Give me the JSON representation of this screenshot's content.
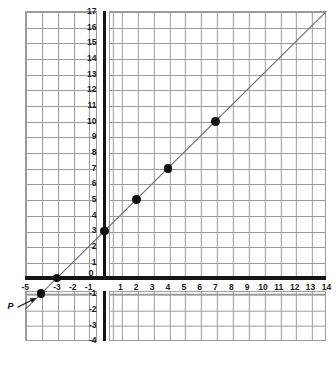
{
  "figure": {
    "kind": "coordinate-grid",
    "background_color": "#ffffff",
    "grid_line_color": "#9b9b9b",
    "axis_color": "#151515",
    "line_color": "#6b6b6b",
    "point_color": "#101010"
  },
  "axes": {
    "x_label": "",
    "y_label": "",
    "origin_label": "0",
    "x_ticks": [
      "-5",
      "-3",
      "-2",
      "-1",
      "1",
      "2",
      "3",
      "4",
      "5",
      "6",
      "7",
      "8",
      "9",
      "10",
      "11",
      "12",
      "13",
      "14"
    ],
    "y_ticks": [
      "17",
      "16",
      "15",
      "14",
      "13",
      "12",
      "11",
      "10",
      "9",
      "8",
      "7",
      "6",
      "5",
      "4",
      "3",
      "2",
      "1",
      "-1",
      "-2",
      "-3",
      "-4"
    ]
  },
  "annotations": {
    "point_label": "P"
  },
  "chart_data": {
    "type": "line",
    "title": "",
    "xlabel": "",
    "ylabel": "",
    "xlim": [
      -5,
      14
    ],
    "ylim": [
      -4,
      17
    ],
    "grid": true,
    "legend": "none",
    "series": [
      {
        "name": "y = x + 3",
        "equation": "y = x + 3",
        "slope": 1,
        "intercept": 3,
        "x": [
          -5,
          14
        ],
        "y": [
          -2,
          17
        ]
      }
    ],
    "points": [
      {
        "x": -4,
        "y": -1,
        "label": "P"
      },
      {
        "x": -3,
        "y": 0,
        "label": ""
      },
      {
        "x": 0,
        "y": 3,
        "label": ""
      },
      {
        "x": 2,
        "y": 5,
        "label": ""
      },
      {
        "x": 4,
        "y": 7,
        "label": ""
      },
      {
        "x": 7,
        "y": 10,
        "label": ""
      }
    ],
    "x_tick_values": [
      -5,
      -3,
      -2,
      -1,
      1,
      2,
      3,
      4,
      5,
      6,
      7,
      8,
      9,
      10,
      11,
      12,
      13,
      14
    ],
    "y_tick_values": [
      17,
      16,
      15,
      14,
      13,
      12,
      11,
      10,
      9,
      8,
      7,
      6,
      5,
      4,
      3,
      2,
      1,
      -1,
      -2,
      -3,
      -4
    ]
  }
}
